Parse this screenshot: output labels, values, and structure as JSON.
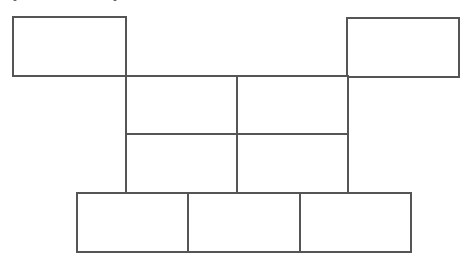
{
  "diagram": {
    "stroke_color": "#555555",
    "stroke_width": 2,
    "fill_color": "#ffffff",
    "rects": [
      {
        "id": "top-left",
        "x": 13,
        "y": 17,
        "w": 113,
        "h": 59
      },
      {
        "id": "top-right",
        "x": 347,
        "y": 18,
        "w": 112,
        "h": 59
      },
      {
        "id": "mid-r1-c1",
        "x": 126,
        "y": 76,
        "w": 111,
        "h": 58
      },
      {
        "id": "mid-r1-c2",
        "x": 237,
        "y": 76,
        "w": 111,
        "h": 58
      },
      {
        "id": "mid-r2-c1",
        "x": 126,
        "y": 134,
        "w": 111,
        "h": 59
      },
      {
        "id": "mid-r2-c2",
        "x": 237,
        "y": 134,
        "w": 111,
        "h": 59
      },
      {
        "id": "bottom-c1",
        "x": 77,
        "y": 193,
        "w": 111,
        "h": 59
      },
      {
        "id": "bottom-c2",
        "x": 188,
        "y": 193,
        "w": 112,
        "h": 59
      },
      {
        "id": "bottom-c3",
        "x": 300,
        "y": 193,
        "w": 111,
        "h": 59
      }
    ],
    "crop_marks": [
      {
        "x": 13
      },
      {
        "x": 113
      }
    ]
  }
}
